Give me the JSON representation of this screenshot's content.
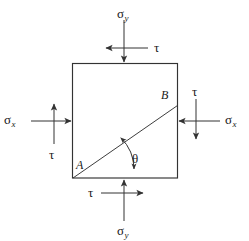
{
  "figure": {
    "name": "plane-stress-element-diagram",
    "colors": {
      "stroke": "#333333",
      "text": "#1a1a1a",
      "background": "#ffffff"
    }
  },
  "element": {
    "square_label": "stress-element-square",
    "diagonal_label": "diagonal-plane-AB",
    "vertices": {
      "a": "A",
      "b": "B"
    },
    "angle": {
      "symbol": "θ",
      "between": "diagonal plane and horizontal bottom edge"
    }
  },
  "loads": {
    "top": {
      "normal": {
        "symbol": "σ",
        "subscript": "y",
        "direction": "down"
      },
      "shear": {
        "symbol": "τ",
        "direction": "left"
      }
    },
    "bottom": {
      "normal": {
        "symbol": "σ",
        "subscript": "y",
        "direction": "up"
      },
      "shear": {
        "symbol": "τ",
        "direction": "right"
      }
    },
    "left": {
      "normal": {
        "symbol": "σ",
        "subscript": "x",
        "direction": "right"
      },
      "shear": {
        "symbol": "τ",
        "direction": "up"
      }
    },
    "right": {
      "normal": {
        "symbol": "σ",
        "subscript": "x",
        "direction": "left"
      },
      "shear": {
        "symbol": "τ",
        "direction": "down"
      }
    }
  }
}
